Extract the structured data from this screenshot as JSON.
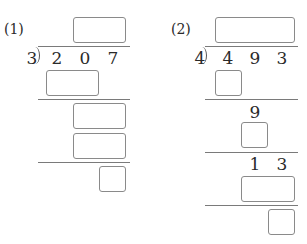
{
  "problems": [
    {
      "label": "(1)",
      "divisor": "3",
      "dividend_digits": [
        "2",
        "0",
        "7"
      ],
      "given_intermediate": []
    },
    {
      "label": "(2)",
      "divisor": "4",
      "dividend_digits": [
        "4",
        "9",
        "3"
      ],
      "given_intermediate": [
        {
          "row": 1,
          "digits": [
            "9"
          ]
        },
        {
          "row": 2,
          "digits": [
            "1",
            "3"
          ]
        }
      ]
    }
  ],
  "colors": {
    "text": "#2a2a2a",
    "box_border": "#8a8a8a",
    "line": "#7a7a7a",
    "background": "#ffffff"
  }
}
